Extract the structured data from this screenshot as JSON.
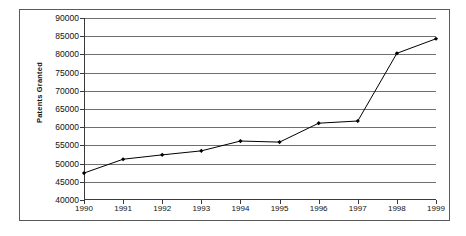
{
  "chart_data": {
    "type": "line",
    "title": "",
    "xlabel": "",
    "ylabel": "Patents Granted",
    "categories": [
      "1990",
      "1991",
      "1992",
      "1993",
      "1994",
      "1995",
      "1996",
      "1997",
      "1998",
      "1999"
    ],
    "values": [
      47400,
      51200,
      52400,
      53500,
      56200,
      55900,
      61100,
      61700,
      80300,
      84300
    ],
    "ylim": [
      40000,
      90000
    ],
    "ytick_step": 5000,
    "ytick_labels": [
      "90000",
      "85000",
      "80000",
      "75000",
      "70000",
      "65000",
      "60000",
      "55000",
      "50000",
      "45000",
      "40000"
    ],
    "grid": true,
    "legend": "none",
    "series": [
      {
        "name": "Patents Granted",
        "values": [
          47400,
          51200,
          52400,
          53500,
          56200,
          55900,
          61100,
          61700,
          80300,
          84300
        ]
      }
    ],
    "colors": {
      "line": "#000000",
      "marker": "#000000",
      "gridline": "#6f6f6f",
      "axis": "#3a3a3a",
      "border": "#5a5a5a",
      "plot_background": "#ffffff",
      "text": "#111111"
    },
    "marker_style": "diamond"
  }
}
